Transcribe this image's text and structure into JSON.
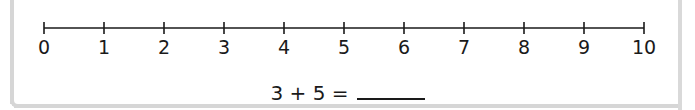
{
  "number_line": {
    "min": 0,
    "max": 10,
    "step": 1,
    "labels": [
      "0",
      "1",
      "2",
      "3",
      "4",
      "5",
      "6",
      "7",
      "8",
      "9",
      "10"
    ]
  },
  "equation": {
    "text": "3 + 5 =",
    "answer": ""
  },
  "colors": {
    "line": "#1a1a1a",
    "frame": "#d6d6d6",
    "background": "#ffffff"
  }
}
